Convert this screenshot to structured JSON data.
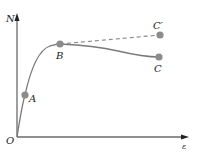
{
  "diagram": {
    "title": "",
    "axes": {
      "y_label": "N",
      "x_label": "ε",
      "origin_label": "O"
    },
    "points": [
      {
        "id": "A",
        "label": "A"
      },
      {
        "id": "B",
        "label": "B"
      },
      {
        "id": "C",
        "label": "C"
      },
      {
        "id": "C_prime",
        "label": "C′"
      }
    ],
    "curves": [
      {
        "name": "O-A-B-C",
        "style": "solid"
      },
      {
        "name": "B-C′",
        "style": "dashed"
      }
    ],
    "colors": {
      "axis": "#6a6a6a",
      "curve": "#7a7a7a",
      "point": "#8c8c8c",
      "text": "#222222"
    }
  }
}
